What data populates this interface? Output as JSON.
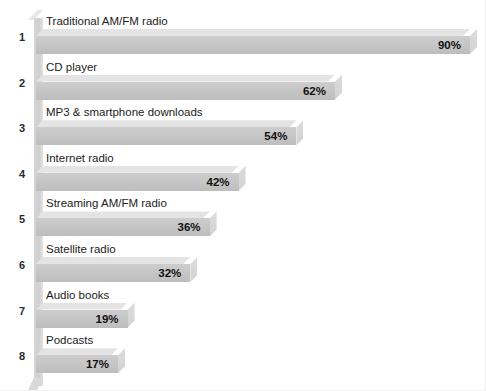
{
  "chart_data": {
    "type": "bar",
    "orientation": "horizontal",
    "title": "",
    "xlabel": "",
    "ylabel": "",
    "xlim": [
      0,
      100
    ],
    "grid": false,
    "legend": null,
    "value_suffix": "%",
    "categories": [
      "Traditional AM/FM radio",
      "CD player",
      "MP3 & smartphone downloads",
      "Internet radio",
      "Streaming AM/FM radio",
      "Satellite radio",
      "Audio books",
      "Podcasts"
    ],
    "values": [
      90,
      62,
      54,
      42,
      36,
      32,
      19,
      17
    ],
    "value_labels": [
      "90%",
      "62%",
      "54%",
      "42%",
      "36%",
      "32%",
      "19%",
      "17%"
    ],
    "rank_labels": [
      "1",
      "2",
      "3",
      "4",
      "5",
      "6",
      "7",
      "8"
    ]
  },
  "rows": [
    {
      "index": "1",
      "label": "Traditional AM/FM radio",
      "value": "90%"
    },
    {
      "index": "2",
      "label": "CD player",
      "value": "62%"
    },
    {
      "index": "3",
      "label": "MP3 & smartphone downloads",
      "value": "54%"
    },
    {
      "index": "4",
      "label": "Internet radio",
      "value": "42%"
    },
    {
      "index": "5",
      "label": "Streaming AM/FM radio",
      "value": "36%"
    },
    {
      "index": "6",
      "label": "Satellite radio",
      "value": "32%"
    },
    {
      "index": "7",
      "label": "Audio books",
      "value": "19%"
    },
    {
      "index": "8",
      "label": "Podcasts",
      "value": "17%"
    }
  ],
  "colors": {
    "bar_body": "#c7c7c7",
    "bar_top": "#e4e4e4",
    "bar_cap": "#d6d6d6",
    "wall": "#d2d2d2",
    "text": "#1c1c1c",
    "background": "#ffffff"
  }
}
